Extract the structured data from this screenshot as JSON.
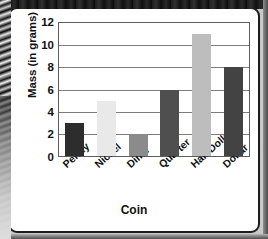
{
  "chart_data": {
    "type": "bar",
    "title": "",
    "xlabel": "Coin",
    "ylabel": "Mass (in grams)",
    "categories": [
      "Penny",
      "Nickel",
      "Dime",
      "Quarter",
      "Half Dollar",
      "Dollar"
    ],
    "values": [
      3,
      5,
      2,
      6,
      11,
      8
    ],
    "bar_colors": [
      "#2d2d2d",
      "#e9e9e9",
      "#8b8b8b",
      "#4f4f4f",
      "#bdbdbd",
      "#434343"
    ],
    "ylim": [
      0,
      12
    ],
    "yticks": [
      0,
      2,
      4,
      6,
      8,
      10,
      12
    ],
    "ytick_labels": [
      "0",
      "2",
      "4",
      "6",
      "8",
      "10",
      "12"
    ],
    "grid": true,
    "grid_axis": "y",
    "legend": false,
    "legend_position": "none",
    "series": [
      {
        "name": "Mass (in grams)",
        "values": [
          3,
          5,
          2,
          6,
          11,
          8
        ]
      }
    ],
    "points": [
      {
        "category": "Penny",
        "value": 3,
        "color": "#2d2d2d"
      },
      {
        "category": "Nickel",
        "value": 5,
        "color": "#e9e9e9"
      },
      {
        "category": "Dime",
        "value": 2,
        "color": "#8b8b8b"
      },
      {
        "category": "Quarter",
        "value": 6,
        "color": "#4f4f4f"
      },
      {
        "category": "Half Dollar",
        "value": 11,
        "color": "#bdbdbd"
      },
      {
        "category": "Dollar",
        "value": 8,
        "color": "#434343"
      }
    ]
  },
  "figure": {
    "background": "#ffffff",
    "frame_color": "#5d5d5d",
    "gridline_color": "#7d7d7d",
    "text_color": "#111111",
    "page_border_color": "#1c1c1c",
    "scan_edge_color": "#1d1d1d"
  }
}
